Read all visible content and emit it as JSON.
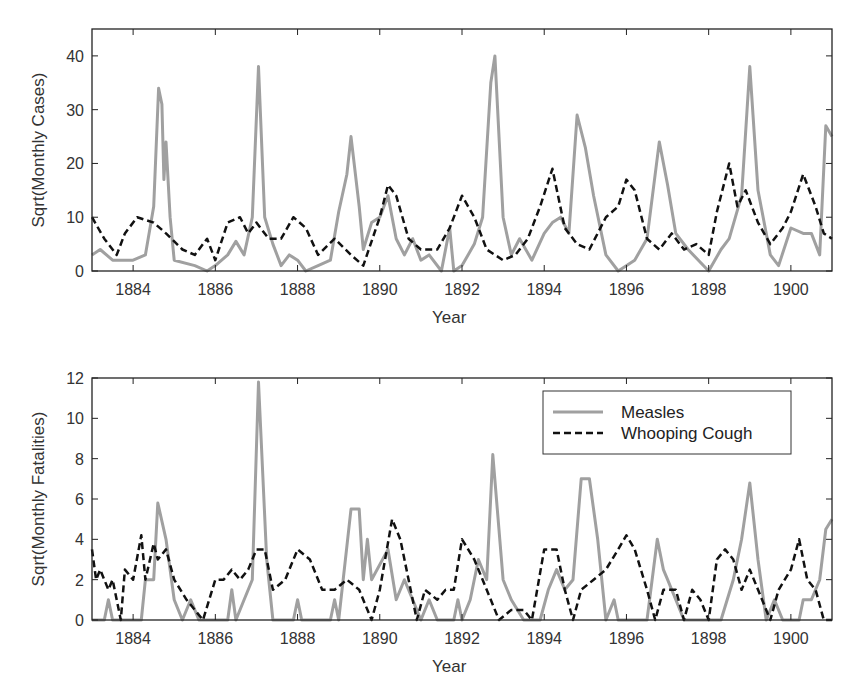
{
  "chart_data": [
    {
      "type": "line",
      "title": "",
      "xlabel": "Year",
      "ylabel": "Sqrt(Monthly Cases)",
      "xlim": [
        1883,
        1901
      ],
      "ylim": [
        0,
        45
      ],
      "xticks": [
        1884,
        1886,
        1888,
        1890,
        1892,
        1894,
        1896,
        1898,
        1900
      ],
      "yticks": [
        0,
        10,
        20,
        30,
        40
      ],
      "grid": false,
      "legend": null,
      "series": [
        {
          "name": "Measles",
          "style": "solid",
          "color": "#a0a0a0",
          "x": [
            1883.0,
            1883.2,
            1883.5,
            1884.0,
            1884.3,
            1884.5,
            1884.62,
            1884.7,
            1884.75,
            1884.8,
            1884.9,
            1885.0,
            1885.5,
            1885.8,
            1886.0,
            1886.3,
            1886.5,
            1886.7,
            1886.9,
            1887.05,
            1887.2,
            1887.4,
            1887.6,
            1887.8,
            1888.0,
            1888.2,
            1888.5,
            1888.8,
            1889.0,
            1889.2,
            1889.3,
            1889.5,
            1889.6,
            1889.8,
            1890.0,
            1890.2,
            1890.4,
            1890.6,
            1890.8,
            1891.0,
            1891.2,
            1891.5,
            1891.7,
            1891.8,
            1892.0,
            1892.3,
            1892.5,
            1892.7,
            1892.8,
            1893.0,
            1893.2,
            1893.4,
            1893.7,
            1894.0,
            1894.2,
            1894.4,
            1894.6,
            1894.8,
            1895.0,
            1895.2,
            1895.5,
            1895.8,
            1896.2,
            1896.5,
            1896.8,
            1897.0,
            1897.2,
            1897.5,
            1898.0,
            1898.3,
            1898.5,
            1898.8,
            1899.0,
            1899.2,
            1899.5,
            1899.7,
            1900.0,
            1900.3,
            1900.5,
            1900.7,
            1900.85,
            1901.0
          ],
          "y": [
            3,
            4,
            2,
            2,
            3,
            12,
            34,
            31,
            17,
            24,
            10,
            2,
            1,
            0,
            1,
            3,
            5.5,
            3,
            10,
            38,
            10,
            5,
            1,
            3,
            2,
            0,
            1,
            2,
            11,
            18,
            25,
            12,
            4,
            9,
            10,
            14,
            6,
            3,
            6,
            2,
            3,
            0,
            8,
            0,
            1,
            5,
            10,
            35,
            40,
            10,
            3,
            6,
            2,
            7,
            9,
            10,
            7,
            29,
            23,
            14,
            3,
            0,
            2,
            6,
            24,
            16,
            7,
            4,
            0,
            4,
            6,
            14,
            38,
            15,
            3,
            1,
            8,
            7,
            7,
            3,
            27,
            25
          ]
        },
        {
          "name": "Whooping Cough",
          "style": "dashed",
          "color": "#111111",
          "x": [
            1883.0,
            1883.3,
            1883.6,
            1883.8,
            1884.1,
            1884.5,
            1884.8,
            1885.2,
            1885.5,
            1885.8,
            1886.0,
            1886.3,
            1886.6,
            1886.8,
            1887.0,
            1887.3,
            1887.6,
            1887.9,
            1888.2,
            1888.5,
            1888.9,
            1889.3,
            1889.6,
            1890.0,
            1890.2,
            1890.4,
            1890.7,
            1891.0,
            1891.4,
            1891.7,
            1892.0,
            1892.3,
            1892.6,
            1893.0,
            1893.3,
            1893.6,
            1893.9,
            1894.2,
            1894.5,
            1894.8,
            1895.1,
            1895.5,
            1895.8,
            1896.0,
            1896.2,
            1896.5,
            1896.8,
            1897.1,
            1897.4,
            1897.7,
            1898.0,
            1898.2,
            1898.5,
            1898.7,
            1898.9,
            1899.2,
            1899.5,
            1899.8,
            1900.0,
            1900.3,
            1900.6,
            1900.8,
            1901.0
          ],
          "y": [
            10,
            6,
            3,
            7,
            10,
            9,
            7,
            4,
            3,
            6,
            2,
            9,
            10,
            7,
            9,
            6,
            6,
            10,
            8,
            3,
            6,
            3,
            1,
            10,
            16,
            14,
            6,
            4,
            4,
            8,
            14,
            10,
            4,
            2,
            3,
            6,
            12,
            19,
            8,
            5,
            4,
            10,
            12,
            17,
            15,
            6,
            4,
            7,
            4,
            5,
            3,
            11,
            20,
            12,
            15,
            9,
            5,
            8,
            11,
            18,
            12,
            7,
            6
          ]
        }
      ]
    },
    {
      "type": "line",
      "title": "",
      "xlabel": "Year",
      "ylabel": "Sqrt(Monthly Fatalities)",
      "xlim": [
        1883,
        1901
      ],
      "ylim": [
        0,
        12
      ],
      "xticks": [
        1884,
        1886,
        1888,
        1890,
        1892,
        1894,
        1896,
        1898,
        1900
      ],
      "yticks": [
        0,
        2,
        4,
        6,
        8,
        10,
        12
      ],
      "grid": false,
      "legend": {
        "position": "upper right",
        "entries": [
          "Measles",
          "Whooping Cough"
        ]
      },
      "series": [
        {
          "name": "Measles",
          "style": "solid",
          "color": "#a0a0a0",
          "x": [
            1883.0,
            1883.3,
            1883.4,
            1883.5,
            1884.2,
            1884.3,
            1884.5,
            1884.6,
            1884.8,
            1885.0,
            1885.2,
            1885.4,
            1885.6,
            1886.3,
            1886.4,
            1886.5,
            1886.7,
            1886.9,
            1887.05,
            1887.25,
            1887.4,
            1887.9,
            1888.0,
            1888.1,
            1888.8,
            1888.9,
            1889.0,
            1889.3,
            1889.5,
            1889.6,
            1889.7,
            1889.8,
            1890.2,
            1890.4,
            1890.6,
            1890.8,
            1891.0,
            1891.2,
            1891.4,
            1891.8,
            1891.9,
            1892.0,
            1892.2,
            1892.4,
            1892.6,
            1892.75,
            1893.0,
            1893.2,
            1893.5,
            1893.9,
            1894.1,
            1894.3,
            1894.5,
            1894.7,
            1894.9,
            1895.1,
            1895.3,
            1895.5,
            1895.7,
            1895.8,
            1896.5,
            1896.75,
            1896.9,
            1897.0,
            1897.2,
            1897.4,
            1898.0,
            1898.3,
            1898.6,
            1898.8,
            1899.0,
            1899.2,
            1899.4,
            1899.6,
            1899.8,
            1900.2,
            1900.3,
            1900.5,
            1900.7,
            1900.85,
            1901.0
          ],
          "y": [
            0,
            0,
            1,
            0,
            0,
            2,
            2,
            5.8,
            4,
            1,
            0,
            1,
            0,
            0,
            1.5,
            0,
            1,
            2,
            11.8,
            3,
            0,
            0,
            1,
            0,
            0,
            1,
            0,
            5.5,
            5.5,
            2,
            4,
            2,
            3.5,
            1,
            2,
            1,
            0,
            1,
            0,
            0,
            1,
            0,
            1,
            3,
            2,
            8.2,
            2,
            1,
            0,
            0,
            1.5,
            2.5,
            1.5,
            2,
            7,
            7,
            4,
            0,
            1,
            0,
            0,
            4,
            2.5,
            2,
            1,
            0,
            0,
            0,
            2,
            4,
            6.8,
            3,
            0,
            1,
            0,
            0,
            1,
            1,
            2,
            4.5,
            5
          ]
        },
        {
          "name": "Whooping Cough",
          "style": "dashed",
          "color": "#111111",
          "x": [
            1883.0,
            1883.1,
            1883.2,
            1883.4,
            1883.5,
            1883.7,
            1883.8,
            1884.0,
            1884.2,
            1884.3,
            1884.5,
            1884.6,
            1884.8,
            1885.0,
            1885.3,
            1885.5,
            1885.7,
            1886.0,
            1886.2,
            1886.4,
            1886.6,
            1886.8,
            1887.0,
            1887.2,
            1887.4,
            1887.7,
            1888.0,
            1888.3,
            1888.6,
            1888.9,
            1889.2,
            1889.5,
            1889.8,
            1890.0,
            1890.3,
            1890.5,
            1890.7,
            1890.9,
            1891.1,
            1891.4,
            1891.6,
            1891.8,
            1892.0,
            1892.3,
            1892.5,
            1892.7,
            1892.9,
            1893.2,
            1893.5,
            1893.7,
            1894.0,
            1894.3,
            1894.5,
            1894.7,
            1894.9,
            1895.2,
            1895.5,
            1895.8,
            1896.0,
            1896.2,
            1896.5,
            1896.7,
            1896.9,
            1897.2,
            1897.4,
            1897.6,
            1897.8,
            1898.0,
            1898.2,
            1898.4,
            1898.6,
            1898.8,
            1899.0,
            1899.3,
            1899.5,
            1899.7,
            1900.0,
            1900.2,
            1900.4,
            1900.6,
            1900.8,
            1901.0
          ],
          "y": [
            3.5,
            2,
            2.5,
            1.5,
            2,
            0,
            2.5,
            2,
            4.2,
            2,
            3.8,
            3,
            3.5,
            2,
            1,
            0.5,
            0,
            2,
            2,
            2.5,
            2,
            2.5,
            3.5,
            3.5,
            1.5,
            2,
            3.5,
            3,
            1.5,
            1.5,
            2,
            1.5,
            0,
            1.5,
            5,
            4,
            2,
            0,
            1.5,
            1,
            1.5,
            1.5,
            4,
            3,
            2,
            1,
            0,
            0.5,
            0.5,
            0,
            3.5,
            3.5,
            1.5,
            0,
            1.5,
            2,
            2.5,
            3.5,
            4.2,
            3.5,
            1.5,
            0,
            1.5,
            1.5,
            0,
            1.5,
            1,
            0,
            3,
            3.5,
            3,
            1.5,
            2.5,
            1,
            0,
            1.5,
            2.5,
            4,
            2,
            1.5,
            0,
            0
          ]
        }
      ]
    }
  ],
  "charts": [
    {
      "ylabel": "Sqrt(Monthly Cases)",
      "xlabel": "Year",
      "xtick_labels": [
        "1884",
        "1886",
        "1888",
        "1890",
        "1892",
        "1894",
        "1896",
        "1898",
        "1900"
      ],
      "ytick_labels": [
        "0",
        "10",
        "20",
        "30",
        "40"
      ]
    },
    {
      "ylabel": "Sqrt(Monthly Fatalities)",
      "xlabel": "Year",
      "xtick_labels": [
        "1884",
        "1886",
        "1888",
        "1890",
        "1892",
        "1894",
        "1896",
        "1898",
        "1900"
      ],
      "ytick_labels": [
        "0",
        "2",
        "4",
        "6",
        "8",
        "10",
        "12"
      ],
      "legend": {
        "measles_label": "Measles",
        "whooping_label": "Whooping Cough"
      }
    }
  ]
}
